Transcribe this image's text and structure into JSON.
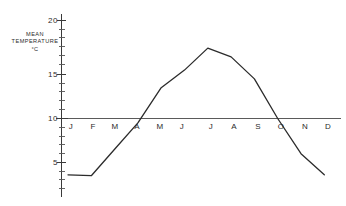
{
  "chart_data": {
    "type": "line",
    "title": "",
    "subtitle": "",
    "xlabel": "",
    "ylabel": "MEAN TEMPERATURE °C",
    "ylabel_lines": [
      "MEAN",
      "TEMPERATURE",
      "°C"
    ],
    "categories": [
      "J",
      "F",
      "M",
      "A",
      "M",
      "J",
      "J",
      "A",
      "S",
      "O",
      "N",
      "D"
    ],
    "category_names": [
      "January",
      "February",
      "March",
      "April",
      "May",
      "June",
      "July",
      "August",
      "September",
      "October",
      "November",
      "December"
    ],
    "values": [
      3.6,
      3.5,
      6.5,
      9.5,
      13.5,
      15.5,
      18.0,
      17.0,
      14.5,
      10.0,
      6.0,
      3.6
    ],
    "series": [
      {
        "name": "Mean temperature",
        "values": [
          3.6,
          3.5,
          6.5,
          9.5,
          13.5,
          15.5,
          18.0,
          17.0,
          14.5,
          10.0,
          6.0,
          3.6
        ]
      }
    ],
    "units": "°C",
    "ylim": [
      0,
      21
    ],
    "ytick_labels": [
      "20",
      "15",
      "10",
      "5"
    ],
    "ytick_values": [
      20,
      15,
      10,
      5
    ],
    "yminor_step": 1,
    "grid": false,
    "legend": false,
    "legend_position": "none",
    "baseline_value": 10,
    "annotations": []
  },
  "axis": {
    "y_label_20": "20",
    "y_label_15": "15",
    "y_label_10": "10",
    "y_label_5": "5"
  },
  "months": {
    "m0": "J",
    "m1": "F",
    "m2": "M",
    "m3": "A",
    "m4": "M",
    "m5": "J",
    "m6": "J",
    "m7": "A",
    "m8": "S",
    "m9": "O",
    "m10": "N",
    "m11": "D"
  },
  "ylabel": {
    "line1": "MEAN",
    "line2": "TEMPERATURE",
    "line3": "°C"
  },
  "colors": {
    "line": "#2b2b2b",
    "axis": "#3a3a3a",
    "baseline": "#5a5a5a",
    "background": "#ffffff"
  }
}
